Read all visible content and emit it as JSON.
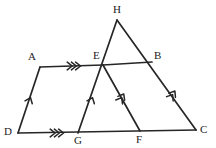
{
  "figure": {
    "width": 216,
    "height": 148,
    "background_color": "#ffffff",
    "stroke_color": "#262626"
  },
  "vertices": [
    {
      "id": "A",
      "label": "A",
      "x": 40,
      "y": 67,
      "label_x": 28,
      "label_y": 51
    },
    {
      "id": "B",
      "label": "B",
      "x": 152,
      "y": 62,
      "label_x": 154,
      "label_y": 50
    },
    {
      "id": "C",
      "label": "C",
      "x": 196,
      "y": 130,
      "label_x": 200,
      "label_y": 124
    },
    {
      "id": "D",
      "label": "D",
      "x": 18,
      "y": 133,
      "label_x": 4,
      "label_y": 126
    },
    {
      "id": "E",
      "label": "E",
      "x": 103,
      "y": 65,
      "label_x": 93,
      "label_y": 50
    },
    {
      "id": "F",
      "label": "F",
      "x": 140,
      "y": 131,
      "label_x": 136,
      "label_y": 134
    },
    {
      "id": "G",
      "label": "G",
      "x": 78,
      "y": 133,
      "label_x": 74,
      "label_y": 135
    },
    {
      "id": "H",
      "label": "H",
      "x": 117,
      "y": 20,
      "label_x": 113,
      "label_y": 4
    }
  ],
  "segments": [
    {
      "id": "A-E",
      "from": "A",
      "to": "E",
      "marks": 3,
      "description": "top-left horizontal segment A to E"
    },
    {
      "id": "D-A",
      "from": "D",
      "to": "A",
      "marks": 1,
      "description": "left slanted side D to A"
    },
    {
      "id": "D-C",
      "from": "D",
      "to": "C",
      "marks": 3,
      "description": "bottom baseline D through G and F to C"
    },
    {
      "id": "H-G",
      "from": "H",
      "to": "G",
      "marks": 0,
      "description": "long line from apex H through E down to G"
    },
    {
      "id": "H-C",
      "from": "H",
      "to": "C",
      "marks": 2,
      "description": "long line from apex H through B down to C"
    },
    {
      "id": "E-B",
      "from": "E",
      "to": "B",
      "marks": 0,
      "description": "horizontal segment E to B"
    },
    {
      "id": "E-F",
      "from": "E",
      "to": "F",
      "marks": 2,
      "description": "slanted segment E down to F"
    }
  ],
  "tick_markers": [
    {
      "id": "mark-AE",
      "segment": "A-E",
      "x": 75,
      "y": 66,
      "count": 3,
      "angle": 0,
      "description": "triple chevron pointing right on A-E"
    },
    {
      "id": "mark-DG",
      "segment": "D-C",
      "x": 58,
      "y": 133,
      "count": 3,
      "angle": 0,
      "description": "triple chevron pointing right on D-G"
    },
    {
      "id": "mark-DA",
      "segment": "D-A",
      "x": 30,
      "y": 99,
      "count": 1,
      "angle": -68,
      "description": "single chevron pointing up on D-A"
    },
    {
      "id": "mark-GE",
      "segment": "H-G",
      "x": 92,
      "y": 99,
      "count": 1,
      "angle": -69,
      "description": "single chevron pointing up on G-E"
    },
    {
      "id": "mark-EF",
      "segment": "E-F",
      "x": 122,
      "y": 97,
      "count": 2,
      "angle": -60,
      "description": "double chevron pointing up on E-F"
    },
    {
      "id": "mark-BC",
      "segment": "H-C",
      "x": 173,
      "y": 94,
      "count": 2,
      "angle": -57,
      "description": "double chevron pointing up on B-C"
    }
  ]
}
